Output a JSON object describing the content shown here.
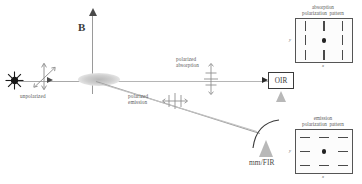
{
  "figure": {
    "background_color": "#ffffff",
    "line_color": "#9a9a9a",
    "text_color": "#5a5a5a"
  },
  "axes": {
    "magnetic_field_label": "B",
    "magnetic_field_direction": "vertical-up",
    "propagation_direction": "horizontal-right"
  },
  "labels": {
    "unpolarized": "unpolarized",
    "polarized_absorption_line1": "polarized",
    "polarized_absorption_line2": "absorption",
    "polarized_emission_line1": "polarized",
    "polarized_emission_line2": "emission",
    "mm_fir": "mm/FIR",
    "oir": "OIR"
  },
  "panels": [
    {
      "id": "absorption-pattern",
      "caption_line1": "absorption",
      "caption_line2": "polarization  pattern",
      "axis_label_y": "y",
      "axis_label_x": "x",
      "tick_orientation": "vertical",
      "center_marker": "dot",
      "rows": 3,
      "cols": 3
    },
    {
      "id": "emission-pattern",
      "caption_line1": "emission",
      "caption_line2": "polarization  pattern",
      "axis_label_y": "y",
      "axis_label_x": "x",
      "tick_orientation": "horizontal",
      "center_marker": "dot",
      "rows": 3,
      "cols": 3
    }
  ],
  "detectors": [
    {
      "id": "oir-detector",
      "label": "OIR",
      "channel": "optical / infrared"
    },
    {
      "id": "mmfir-detector",
      "label": "mm/FIR",
      "channel": "millimeter / far-infrared"
    }
  ],
  "colors": {
    "line": "#9a9a9a",
    "tick": "#4a4a4a",
    "dot": "#222222",
    "horn": "#b8b8b8",
    "panel_border": "#555555",
    "text": "#5a5a5a"
  }
}
